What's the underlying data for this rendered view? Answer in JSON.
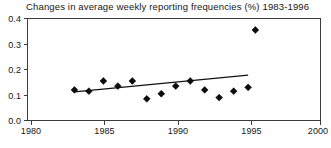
{
  "chart_data": {
    "type": "scatter",
    "title": "Changes in average weekly reporting frequencies (%) 1983-1996",
    "xlabel": "",
    "ylabel": "",
    "xlim": [
      1980,
      2000
    ],
    "ylim": [
      0.0,
      0.4
    ],
    "grid": false,
    "legend": null,
    "x_ticks": [
      1980,
      1985,
      1990,
      1995,
      2000
    ],
    "x_tick_labels": [
      "1980",
      "1985",
      "1990",
      "1995",
      "2000"
    ],
    "y_ticks": [
      0.0,
      0.1,
      0.2,
      0.3,
      0.4
    ],
    "y_tick_labels": [
      "0.0",
      "0.1",
      "0.2",
      "0.3",
      "0.4"
    ],
    "marker": "diamond",
    "marker_color": "#0b0b0b",
    "series": [
      {
        "name": "Average weekly reporting frequency change",
        "x": [
          1983,
          1984,
          1985,
          1986,
          1987,
          1988,
          1989,
          1990,
          1991,
          1992,
          1993,
          1994,
          1995,
          1995.5
        ],
        "y": [
          0.12,
          0.115,
          0.155,
          0.135,
          0.155,
          0.085,
          0.105,
          0.135,
          0.155,
          0.12,
          0.09,
          0.115,
          0.13,
          0.355
        ]
      }
    ],
    "trendline": {
      "type": "linear",
      "x_start": 1983,
      "x_end": 1995,
      "y_start": 0.112,
      "y_end": 0.178
    }
  }
}
